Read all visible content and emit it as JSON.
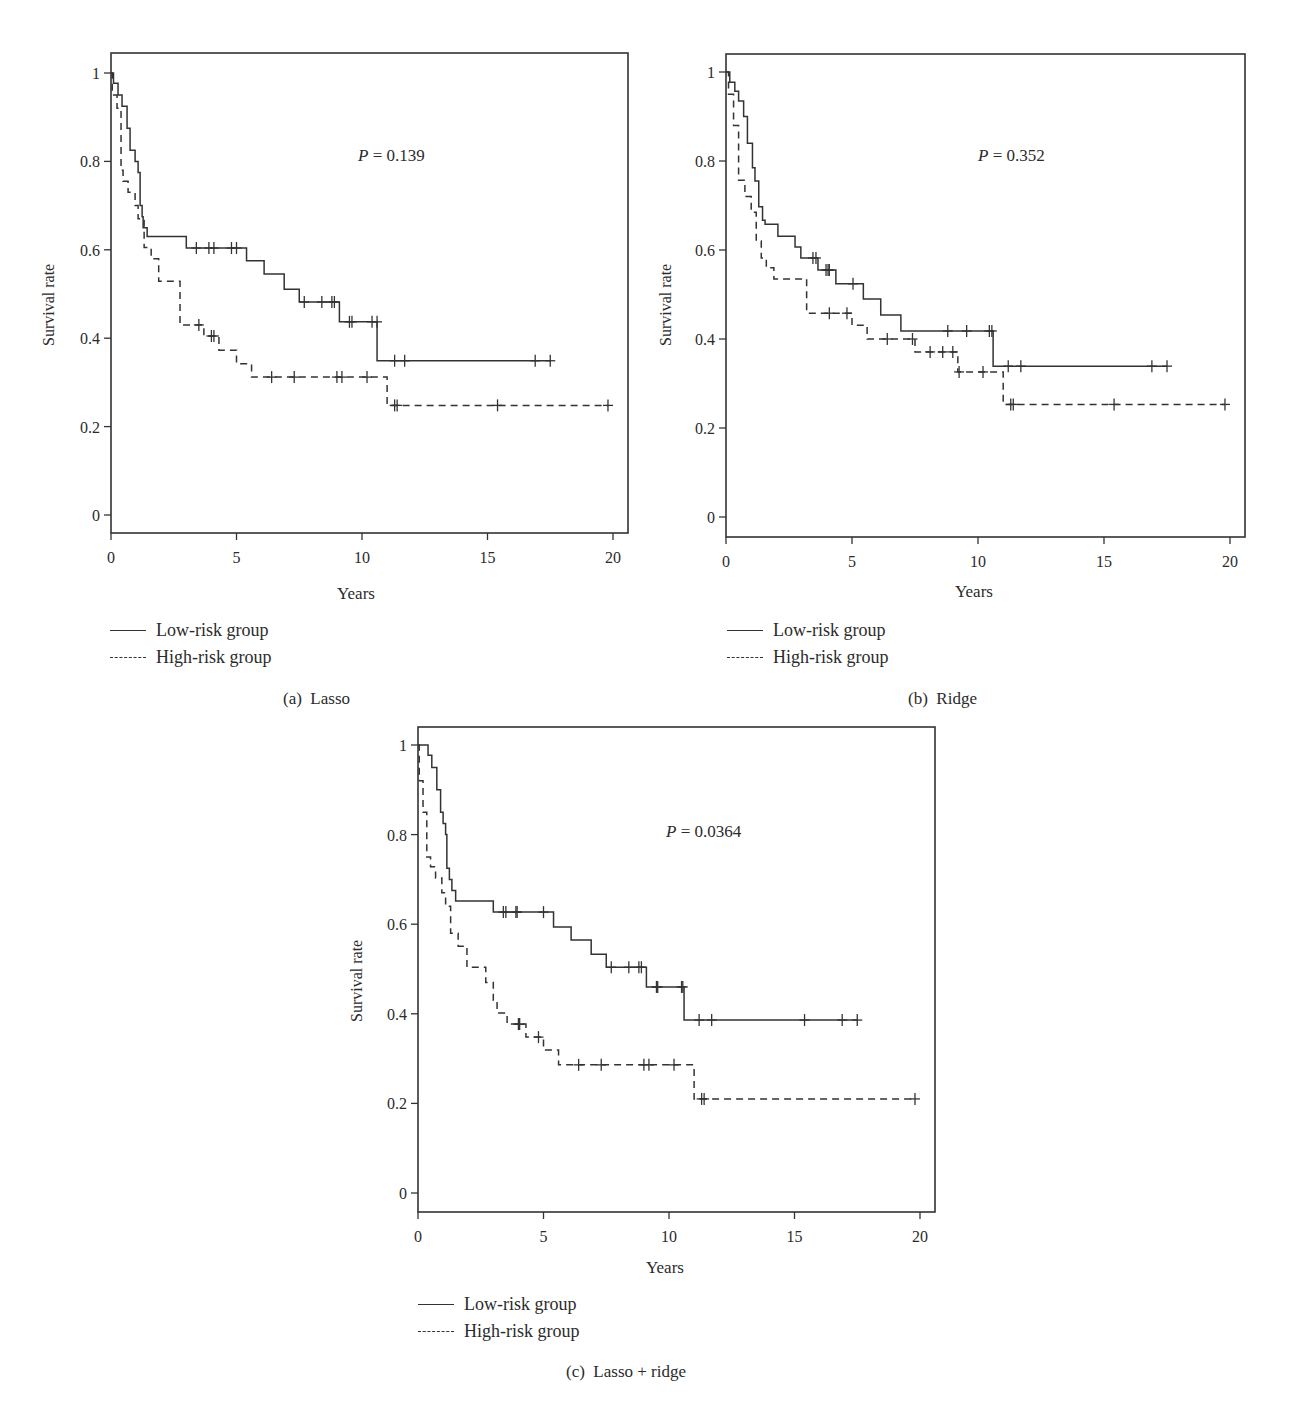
{
  "figure": {
    "panels": [
      {
        "id": "a",
        "caption": "(a)  Lasso",
        "p_label": "P",
        "p_value": "= 0.139",
        "ylabel": "Survival rate",
        "xlabel": "Years",
        "legend": [
          "Low-risk group",
          "High-risk group"
        ]
      },
      {
        "id": "b",
        "caption": "(b)  Ridge",
        "p_label": "P",
        "p_value": "= 0.352",
        "ylabel": "Survival rate",
        "xlabel": "Years",
        "legend": [
          "Low-risk group",
          "High-risk group"
        ]
      },
      {
        "id": "c",
        "caption": "(c)  Lasso + ridge",
        "p_label": "P",
        "p_value": "= 0.0364",
        "ylabel": "Survival rate",
        "xlabel": "Years",
        "legend": [
          "Low-risk group",
          "High-risk group"
        ]
      }
    ],
    "line_color": "#333333"
  },
  "chart_data": [
    {
      "type": "line",
      "subtype": "kaplan-meier step",
      "title": "(a) Lasso",
      "annotation": "P = 0.139",
      "xlabel": "Years",
      "ylabel": "Survival rate",
      "xlim": [
        0,
        20.6
      ],
      "ylim": [
        -0.04,
        1.05
      ],
      "xticks": [
        0,
        5,
        10,
        15,
        20
      ],
      "yticks": [
        0,
        0.2,
        0.4,
        0.6,
        0.8,
        1
      ],
      "ytick_labels": [
        "0",
        "0.2",
        "0.4",
        "0.6",
        "0.8",
        "1"
      ],
      "grid": false,
      "legend_position": "below-left",
      "series": [
        {
          "name": "Low-risk group",
          "style": "solid",
          "steps": [
            [
              0,
              1.0
            ],
            [
              0.1,
              0.977
            ],
            [
              0.28,
              0.95
            ],
            [
              0.44,
              0.925
            ],
            [
              0.64,
              0.875
            ],
            [
              0.76,
              0.825
            ],
            [
              0.96,
              0.8
            ],
            [
              1.08,
              0.775
            ],
            [
              1.16,
              0.7
            ],
            [
              1.24,
              0.675
            ],
            [
              1.28,
              0.65
            ],
            [
              1.44,
              0.63
            ],
            [
              3.0,
              0.604
            ],
            [
              5.4,
              0.575
            ],
            [
              6.1,
              0.545
            ],
            [
              6.9,
              0.511
            ],
            [
              7.5,
              0.482
            ],
            [
              9.1,
              0.437
            ],
            [
              10.6,
              0.349
            ]
          ],
          "end": 17.5,
          "censored": [
            [
              3.4,
              0.604
            ],
            [
              3.9,
              0.604
            ],
            [
              4.1,
              0.604
            ],
            [
              4.8,
              0.604
            ],
            [
              5.0,
              0.604
            ],
            [
              7.7,
              0.482
            ],
            [
              8.4,
              0.482
            ],
            [
              8.8,
              0.482
            ],
            [
              8.9,
              0.482
            ],
            [
              9.5,
              0.437
            ],
            [
              9.6,
              0.437
            ],
            [
              10.4,
              0.437
            ],
            [
              10.6,
              0.437
            ],
            [
              11.3,
              0.349
            ],
            [
              11.7,
              0.349
            ],
            [
              16.9,
              0.349
            ],
            [
              17.5,
              0.349
            ]
          ]
        },
        {
          "name": "High-risk group",
          "style": "dashed",
          "steps": [
            [
              0,
              1.0
            ],
            [
              0.05,
              0.95
            ],
            [
              0.24,
              0.92
            ],
            [
              0.4,
              0.78
            ],
            [
              0.48,
              0.755
            ],
            [
              0.68,
              0.73
            ],
            [
              0.96,
              0.7
            ],
            [
              1.08,
              0.67
            ],
            [
              1.32,
              0.605
            ],
            [
              1.6,
              0.58
            ],
            [
              1.9,
              0.529
            ],
            [
              2.75,
              0.43
            ],
            [
              3.7,
              0.405
            ],
            [
              4.3,
              0.373
            ],
            [
              5.0,
              0.342
            ],
            [
              5.6,
              0.312
            ],
            [
              11.0,
              0.248
            ]
          ],
          "end": 19.8,
          "censored": [
            [
              3.5,
              0.43
            ],
            [
              4.0,
              0.405
            ],
            [
              4.1,
              0.405
            ],
            [
              6.4,
              0.312
            ],
            [
              7.3,
              0.312
            ],
            [
              9.0,
              0.312
            ],
            [
              9.2,
              0.312
            ],
            [
              10.2,
              0.312
            ],
            [
              11.3,
              0.248
            ],
            [
              11.4,
              0.248
            ],
            [
              15.4,
              0.248
            ],
            [
              19.8,
              0.248
            ]
          ]
        }
      ]
    },
    {
      "type": "line",
      "subtype": "kaplan-meier step",
      "title": "(b) Ridge",
      "annotation": "P = 0.352",
      "xlabel": "Years",
      "ylabel": "Survival rate",
      "xlim": [
        0,
        20.6
      ],
      "ylim": [
        -0.04,
        1.05
      ],
      "xticks": [
        0,
        5,
        10,
        15,
        20
      ],
      "yticks": [
        0,
        0.2,
        0.4,
        0.6,
        0.8,
        1
      ],
      "ytick_labels": [
        "0",
        "0.2",
        "0.4",
        "0.6",
        "0.8",
        "1"
      ],
      "grid": false,
      "legend_position": "below-left",
      "series": [
        {
          "name": "Low-risk group",
          "style": "solid",
          "steps": [
            [
              0,
              1.0
            ],
            [
              0.15,
              0.977
            ],
            [
              0.35,
              0.957
            ],
            [
              0.5,
              0.935
            ],
            [
              0.7,
              0.9
            ],
            [
              0.85,
              0.84
            ],
            [
              1.05,
              0.785
            ],
            [
              1.15,
              0.755
            ],
            [
              1.3,
              0.697
            ],
            [
              1.45,
              0.667
            ],
            [
              1.55,
              0.658
            ],
            [
              2.06,
              0.631
            ],
            [
              2.74,
              0.607
            ],
            [
              2.97,
              0.582
            ],
            [
              3.65,
              0.555
            ],
            [
              4.36,
              0.524
            ],
            [
              5.45,
              0.49
            ],
            [
              6.14,
              0.454
            ],
            [
              6.94,
              0.418
            ],
            [
              10.6,
              0.339
            ]
          ],
          "end": 17.5,
          "censored": [
            [
              3.45,
              0.582
            ],
            [
              3.57,
              0.582
            ],
            [
              3.97,
              0.555
            ],
            [
              4.05,
              0.555
            ],
            [
              4.1,
              0.555
            ],
            [
              5.04,
              0.524
            ],
            [
              8.8,
              0.418
            ],
            [
              9.55,
              0.418
            ],
            [
              10.45,
              0.418
            ],
            [
              10.55,
              0.418
            ],
            [
              11.2,
              0.339
            ],
            [
              11.7,
              0.339
            ],
            [
              16.9,
              0.339
            ],
            [
              17.5,
              0.339
            ]
          ]
        },
        {
          "name": "High-risk group",
          "style": "dashed",
          "steps": [
            [
              0,
              1.0
            ],
            [
              0.1,
              0.95
            ],
            [
              0.3,
              0.88
            ],
            [
              0.5,
              0.757
            ],
            [
              0.75,
              0.72
            ],
            [
              1.0,
              0.685
            ],
            [
              1.2,
              0.62
            ],
            [
              1.4,
              0.582
            ],
            [
              1.6,
              0.56
            ],
            [
              1.9,
              0.535
            ],
            [
              3.2,
              0.458
            ],
            [
              5.0,
              0.431
            ],
            [
              5.6,
              0.4
            ],
            [
              7.5,
              0.371
            ],
            [
              9.2,
              0.326
            ],
            [
              11.0,
              0.253
            ]
          ],
          "end": 19.8,
          "censored": [
            [
              4.1,
              0.458
            ],
            [
              4.8,
              0.458
            ],
            [
              6.4,
              0.4
            ],
            [
              7.4,
              0.4
            ],
            [
              8.1,
              0.371
            ],
            [
              8.6,
              0.371
            ],
            [
              9.0,
              0.371
            ],
            [
              9.25,
              0.326
            ],
            [
              10.2,
              0.326
            ],
            [
              11.3,
              0.253
            ],
            [
              11.4,
              0.253
            ],
            [
              15.4,
              0.253
            ],
            [
              19.8,
              0.253
            ]
          ]
        }
      ]
    },
    {
      "type": "line",
      "subtype": "kaplan-meier step",
      "title": "(c) Lasso + ridge",
      "annotation": "P = 0.0364",
      "xlabel": "Years",
      "ylabel": "Survival rate",
      "xlim": [
        0,
        20.6
      ],
      "ylim": [
        -0.04,
        1.04
      ],
      "xticks": [
        0,
        5,
        10,
        15,
        20
      ],
      "yticks": [
        0,
        0.2,
        0.4,
        0.6,
        0.8,
        1
      ],
      "ytick_labels": [
        "0",
        "0.2",
        "0.4",
        "0.6",
        "0.8",
        "1"
      ],
      "grid": false,
      "legend_position": "below-left",
      "series": [
        {
          "name": "Low-risk group",
          "style": "solid",
          "steps": [
            [
              0,
              1.0
            ],
            [
              0.4,
              0.977
            ],
            [
              0.55,
              0.95
            ],
            [
              0.75,
              0.9
            ],
            [
              0.9,
              0.85
            ],
            [
              1.0,
              0.825
            ],
            [
              1.1,
              0.8
            ],
            [
              1.15,
              0.725
            ],
            [
              1.25,
              0.7
            ],
            [
              1.35,
              0.675
            ],
            [
              1.5,
              0.652
            ],
            [
              3.0,
              0.627
            ],
            [
              5.4,
              0.594
            ],
            [
              6.1,
              0.565
            ],
            [
              6.9,
              0.533
            ],
            [
              7.5,
              0.504
            ],
            [
              9.1,
              0.46
            ],
            [
              10.6,
              0.386
            ]
          ],
          "end": 17.5,
          "censored": [
            [
              3.4,
              0.627
            ],
            [
              3.5,
              0.627
            ],
            [
              3.9,
              0.627
            ],
            [
              3.95,
              0.627
            ],
            [
              5.0,
              0.627
            ],
            [
              7.7,
              0.504
            ],
            [
              8.4,
              0.504
            ],
            [
              8.8,
              0.504
            ],
            [
              8.9,
              0.504
            ],
            [
              9.5,
              0.46
            ],
            [
              9.55,
              0.46
            ],
            [
              10.5,
              0.46
            ],
            [
              10.55,
              0.46
            ],
            [
              11.2,
              0.386
            ],
            [
              11.7,
              0.386
            ],
            [
              15.4,
              0.386
            ],
            [
              16.9,
              0.386
            ],
            [
              17.5,
              0.386
            ]
          ]
        },
        {
          "name": "High-risk group",
          "style": "dashed",
          "steps": [
            [
              0,
              1.0
            ],
            [
              0.05,
              0.92
            ],
            [
              0.2,
              0.85
            ],
            [
              0.35,
              0.75
            ],
            [
              0.5,
              0.728
            ],
            [
              0.7,
              0.703
            ],
            [
              0.95,
              0.67
            ],
            [
              1.1,
              0.64
            ],
            [
              1.3,
              0.58
            ],
            [
              1.6,
              0.551
            ],
            [
              1.95,
              0.504
            ],
            [
              2.7,
              0.47
            ],
            [
              3.0,
              0.43
            ],
            [
              3.15,
              0.402
            ],
            [
              3.55,
              0.377
            ],
            [
              4.3,
              0.348
            ],
            [
              5.0,
              0.319
            ],
            [
              5.6,
              0.286
            ],
            [
              11.0,
              0.21
            ]
          ],
          "end": 19.8,
          "censored": [
            [
              4.0,
              0.377
            ],
            [
              4.05,
              0.377
            ],
            [
              4.8,
              0.348
            ],
            [
              6.4,
              0.286
            ],
            [
              7.3,
              0.286
            ],
            [
              9.0,
              0.286
            ],
            [
              9.2,
              0.286
            ],
            [
              10.2,
              0.286
            ],
            [
              11.3,
              0.21
            ],
            [
              11.4,
              0.21
            ],
            [
              19.8,
              0.21
            ]
          ]
        }
      ]
    }
  ]
}
